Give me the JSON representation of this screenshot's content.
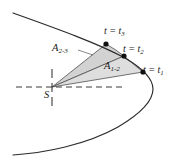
{
  "figure": {
    "background_color": "#ffffff",
    "curve_color": "#2b2b2b",
    "sector_fill_near": "#cfcfcf",
    "sector_fill_far": "#dcdcdc",
    "sector_stroke": "#4a4a4a",
    "dash_color": "#3a3a3a",
    "point_color": "#111111",
    "labels": {
      "t3": {
        "text": "t = t",
        "sub": "3"
      },
      "t2": {
        "text": "t = t",
        "sub": "2"
      },
      "t1": {
        "text": "t = t",
        "sub": "1"
      },
      "area_2_3": {
        "text": "A",
        "sub": "2-3"
      },
      "area_1_2": {
        "text": "A",
        "sub": "1-2"
      },
      "focus": {
        "text": "S"
      }
    },
    "points": {
      "focus": {
        "x": 52,
        "y": 87,
        "name": "S"
      },
      "t1": {
        "x": 143,
        "y": 72
      },
      "t2": {
        "x": 124,
        "y": 56
      },
      "t3": {
        "x": 106,
        "y": 44
      }
    },
    "guides": {
      "horizontal_dashed": {
        "x1": 16,
        "y1": 87,
        "x2": 126,
        "y2": 87
      },
      "vertical_dashed": {
        "x": 52,
        "y1": 69,
        "y2": 106
      }
    },
    "orbit": {
      "type": "conic-section",
      "upper_branch_start": {
        "x": 13,
        "y": 13
      },
      "vertex": {
        "x": 153,
        "y": 87
      },
      "lower_branch_end": {
        "x": 13,
        "y": 155
      }
    },
    "leader_line": {
      "x1": 78,
      "y1": 50,
      "x2": 92,
      "y2": 54
    }
  }
}
